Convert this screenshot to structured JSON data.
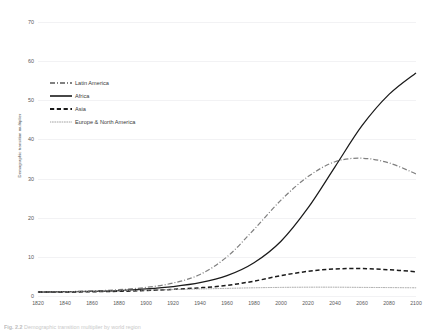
{
  "figure": {
    "caption_label": "Fig. 2.2",
    "caption_text": "Demographic transition multiplier by world region"
  },
  "axes": {
    "ylabel": "Demographic transition multiplier",
    "xlabel": "",
    "yticks": [
      0,
      10,
      20,
      30,
      40,
      50,
      60,
      70
    ],
    "xticks": [
      1820,
      1840,
      1860,
      1880,
      1900,
      1920,
      1940,
      1960,
      1980,
      2000,
      2020,
      2040,
      2060,
      2080,
      2100
    ]
  },
  "legend": {
    "position": "top-left",
    "items": [
      {
        "label": "Latin America",
        "style": "dash-dot",
        "color": "#808080",
        "icon": "line-dash-dot-icon"
      },
      {
        "label": "Africa",
        "style": "solid",
        "color": "#1a1a1a",
        "icon": "line-solid-icon"
      },
      {
        "label": "Asia",
        "style": "dashed",
        "color": "#1a1a1a",
        "icon": "line-dashed-icon"
      },
      {
        "label": "Europe & North America",
        "style": "dotted",
        "color": "#9a9a9a",
        "icon": "line-dotted-icon"
      }
    ]
  },
  "colors": {
    "gridline": "#f2f2f4",
    "africa": "#1a1a1a",
    "asia": "#1a1a1a",
    "latin_america": "#808080",
    "europe_north_america": "#9a9a9a",
    "tick_text": "#595959"
  },
  "chart_data": {
    "type": "line",
    "title": "",
    "xlabel": "",
    "ylabel": "Demographic transition multiplier",
    "xlim": [
      1820,
      2100
    ],
    "ylim": [
      0,
      70
    ],
    "grid": true,
    "legend_position": "top-left",
    "x": [
      1820,
      1840,
      1860,
      1880,
      1900,
      1920,
      1940,
      1960,
      1980,
      2000,
      2020,
      2040,
      2060,
      2080,
      2100
    ],
    "series": [
      {
        "name": "Latin America",
        "style": "dash-dot",
        "color": "#808080",
        "values": [
          1.0,
          1.1,
          1.3,
          1.6,
          2.2,
          3.3,
          5.5,
          10.0,
          17.0,
          24.5,
          30.5,
          34.3,
          35.2,
          34.0,
          31.2
        ]
      },
      {
        "name": "Africa",
        "style": "solid",
        "color": "#1a1a1a",
        "values": [
          1.0,
          1.1,
          1.2,
          1.4,
          1.8,
          2.4,
          3.4,
          5.2,
          8.5,
          14.0,
          22.5,
          33.0,
          43.5,
          51.5,
          57.0
        ]
      },
      {
        "name": "Asia",
        "style": "dashed",
        "color": "#1a1a1a",
        "values": [
          1.0,
          1.0,
          1.1,
          1.2,
          1.4,
          1.7,
          2.1,
          2.7,
          3.8,
          5.2,
          6.3,
          6.9,
          7.0,
          6.7,
          6.2
        ]
      },
      {
        "name": "Europe & North America",
        "style": "dotted",
        "color": "#9a9a9a",
        "values": [
          1.0,
          1.1,
          1.2,
          1.35,
          1.5,
          1.65,
          1.8,
          1.95,
          2.1,
          2.2,
          2.25,
          2.25,
          2.2,
          2.15,
          2.1
        ]
      }
    ]
  }
}
